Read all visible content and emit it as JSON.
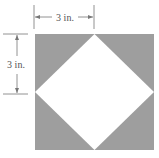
{
  "figure": {
    "colors": {
      "square_fill": "#9e9e9e",
      "diamond_fill": "#ffffff",
      "dimension_lines": "#777777",
      "label_text": "#555555"
    }
  },
  "dimensions": {
    "top": {
      "label": "3 in.",
      "orientation": "horizontal"
    },
    "left": {
      "label": "3 in.",
      "orientation": "vertical"
    }
  }
}
